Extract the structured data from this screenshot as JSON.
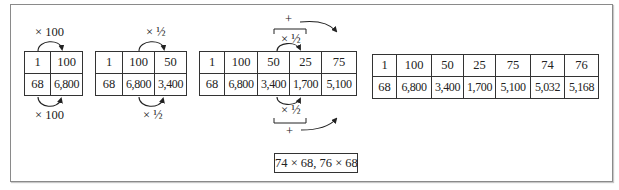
{
  "tables": [
    {
      "top": [
        "1",
        "100"
      ],
      "bottom": [
        "68",
        "6,800"
      ]
    },
    {
      "top": [
        "1",
        "100",
        "50"
      ],
      "bottom": [
        "68",
        "6,800",
        "3,400"
      ]
    },
    {
      "top": [
        "1",
        "100",
        "50",
        "25",
        "75"
      ],
      "bottom": [
        "68",
        "6,800",
        "3,400",
        "1,700",
        "5,100"
      ]
    },
    {
      "top": [
        "1",
        "100",
        "50",
        "25",
        "75",
        "74",
        "76"
      ],
      "bottom": [
        "68",
        "6,800",
        "3,400",
        "1,700",
        "5,100",
        "5,032",
        "5,168"
      ]
    }
  ],
  "annotations": {
    "t1_top": "× 100",
    "t1_bottom": "× 100",
    "t2_top": "× ½",
    "t2_bottom": "× ½",
    "t3_top_half": "× ½",
    "t3_top_plus": "+",
    "t3_bottom_half": "× ½",
    "t3_bottom_plus": "+"
  },
  "answer": "74 × 68, 76 × 68"
}
